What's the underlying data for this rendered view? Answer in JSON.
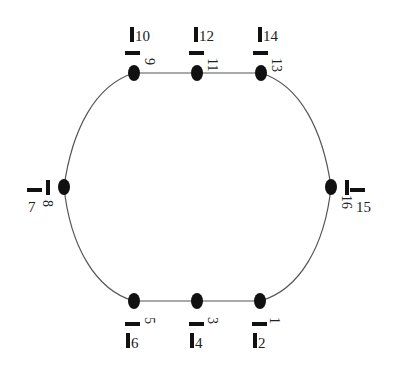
{
  "diagram": {
    "type": "track-loop",
    "line_color": "#555555",
    "node_color": "#111111",
    "nodes": [
      {
        "id": "n1",
        "x": 134,
        "y": 73
      },
      {
        "id": "n2",
        "x": 197,
        "y": 73
      },
      {
        "id": "n3",
        "x": 261,
        "y": 73
      },
      {
        "id": "n4",
        "x": 331,
        "y": 187
      },
      {
        "id": "n5",
        "x": 260,
        "y": 301
      },
      {
        "id": "n6",
        "x": 197,
        "y": 301
      },
      {
        "id": "n7",
        "x": 134,
        "y": 301
      },
      {
        "id": "n8",
        "x": 64,
        "y": 187
      }
    ],
    "labels": {
      "l1": "1",
      "l2": "2",
      "l3": "3",
      "l4": "4",
      "l5": "5",
      "l6": "6",
      "l7": "7",
      "l8": "8",
      "l9": "9",
      "l10": "10",
      "l11": "11",
      "l12": "12",
      "l13": "13",
      "l14": "14",
      "l15": "15",
      "l16": "16"
    }
  }
}
